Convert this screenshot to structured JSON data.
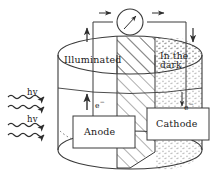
{
  "figure": {
    "type": "diagram",
    "colors": {
      "line": "#3a3a3a",
      "text": "#1a1a1a",
      "background": "#ffffff",
      "hatch": "#555555",
      "stipple": "#666666"
    }
  },
  "labels": {
    "illuminated": "Illuminated",
    "dark_line1": "In the",
    "dark_line2": "dark",
    "anode": "Anode",
    "cathode": "Cathode",
    "photon_1": "hv",
    "photon_2": "hv",
    "electron_left": "e",
    "electron_left_sup": "−",
    "electron_right": "e",
    "electron_right_sup": "−"
  },
  "icons": {
    "meter": "meter-gauge-icon",
    "arrow_right_top_left": "arrow-right-icon",
    "arrow_right_top_right": "arrow-right-icon",
    "arrow_up_wire": "arrow-up-icon",
    "arrow_down_wire": "arrow-down-icon",
    "arrow_up_electron": "arrow-up-icon",
    "arrow_down_electron": "arrow-down-icon",
    "photon_wave_1": "wavy-arrow-icon",
    "photon_wave_2": "wavy-arrow-icon",
    "photon_wave_3": "wavy-arrow-icon",
    "photon_wave_4": "wavy-arrow-icon"
  },
  "regions": {
    "left_region": "illuminated-clear-region",
    "middle_region": "hatched-separator-region",
    "right_region": "stippled-dark-region"
  }
}
